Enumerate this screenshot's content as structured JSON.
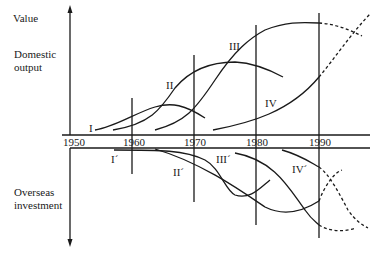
{
  "labels": {
    "y_axis_top": "Value",
    "top_panel": [
      "Domestic",
      "output"
    ],
    "bottom_panel": [
      "Overseas",
      "investment"
    ]
  },
  "years": [
    "1950",
    "1960",
    "1970",
    "1980",
    "1990"
  ],
  "domestic_curves": [
    {
      "id": "I",
      "label": "I"
    },
    {
      "id": "II",
      "label": "II"
    },
    {
      "id": "III",
      "label": "III"
    },
    {
      "id": "IV",
      "label": "IV"
    }
  ],
  "overseas_curves": [
    {
      "id": "I'",
      "label": "I´"
    },
    {
      "id": "II'",
      "label": "II´"
    },
    {
      "id": "III'",
      "label": "III´"
    },
    {
      "id": "IV'",
      "label": "IV´"
    }
  ],
  "colors": {
    "ink": "#1a1a1a",
    "background": "#ffffff"
  }
}
